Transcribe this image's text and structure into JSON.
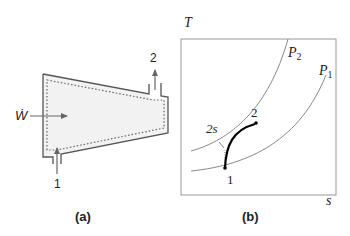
{
  "panel_a": {
    "caption": "(a)",
    "work_label": "Ẇ",
    "inlet_label": "1",
    "outlet_label": "2",
    "fill_color": "#f2f2f2",
    "stroke_color": "#555555"
  },
  "panel_b": {
    "caption": "(b)",
    "y_axis_label": "T",
    "x_axis_label": "s",
    "curve_labels": {
      "p2": "P",
      "p2_sub": "2",
      "p1": "P",
      "p1_sub": "1"
    },
    "point_labels": {
      "state1": "1",
      "state2": "2",
      "state2s": "2s"
    },
    "process_color": "#000000",
    "isobar_color": "#888888"
  }
}
